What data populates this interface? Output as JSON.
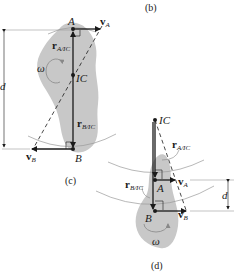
{
  "figure": {
    "captions": {
      "b": "(b)",
      "c": "(c)",
      "d": "(d)"
    },
    "panel_c": {
      "points": {
        "A": "A",
        "B": "B",
        "IC": "IC"
      },
      "vectors": {
        "vA": "v",
        "vA_sub": "A",
        "vB": "v",
        "vB_sub": "B"
      },
      "position_vectors": {
        "rA": "r",
        "rA_sub": "A/IC",
        "rB": "r",
        "rB_sub": "B/IC"
      },
      "angular_velocity": "ω",
      "distance": "d"
    },
    "panel_d": {
      "points": {
        "A": "A",
        "B": "B",
        "IC": "IC"
      },
      "vectors": {
        "vA": "v",
        "vA_sub": "A",
        "vB": "v",
        "vB_sub": "B"
      },
      "position_vectors": {
        "rA": "r",
        "rA_sub": "A/IC",
        "rB": "r",
        "rB_sub": "B/IC"
      },
      "angular_velocity": "ω",
      "distance": "d"
    },
    "colors": {
      "body": "#c8c8c8",
      "line": "#1a1a1a",
      "arc": "#9a9a9a"
    }
  }
}
